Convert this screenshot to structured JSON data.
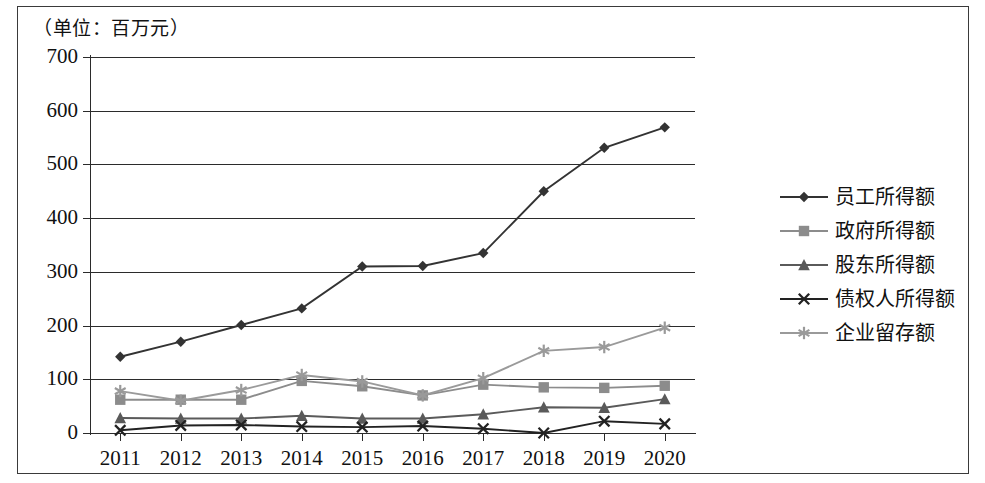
{
  "chart_data": {
    "type": "line",
    "title": "（单位：百万元）",
    "xlabel": "",
    "ylabel": "",
    "ylim": [
      0,
      700
    ],
    "ytick_step": 100,
    "yticks": [
      "0",
      "100",
      "200",
      "300",
      "400",
      "500",
      "600",
      "700"
    ],
    "grid": true,
    "legend_position": "right",
    "categories": [
      "2011",
      "2012",
      "2013",
      "2014",
      "2015",
      "2016",
      "2017",
      "2018",
      "2019",
      "2020"
    ],
    "series": [
      {
        "name": "员工所得额",
        "marker": "diamond",
        "color": "#333333",
        "values": [
          142,
          170,
          201,
          232,
          310,
          311,
          335,
          450,
          531,
          569
        ]
      },
      {
        "name": "政府所得额",
        "marker": "square",
        "color": "#8c8c8c",
        "values": [
          62,
          62,
          62,
          97,
          87,
          70,
          90,
          85,
          84,
          88
        ]
      },
      {
        "name": "股东所得额",
        "marker": "triangle",
        "color": "#5a5a5a",
        "values": [
          28,
          27,
          27,
          32,
          27,
          27,
          35,
          48,
          47,
          63
        ]
      },
      {
        "name": "债权人所得额",
        "marker": "cross",
        "color": "#222222",
        "values": [
          5,
          14,
          15,
          12,
          11,
          13,
          8,
          0,
          22,
          17
        ]
      },
      {
        "name": "企业留存额",
        "marker": "asterisk",
        "color": "#9a9a9a",
        "values": [
          78,
          60,
          80,
          108,
          96,
          70,
          102,
          153,
          160,
          196
        ]
      }
    ]
  },
  "legend": {
    "items": [
      {
        "label": "员工所得额"
      },
      {
        "label": "政府所得额"
      },
      {
        "label": "股东所得额"
      },
      {
        "label": "债权人所得额"
      },
      {
        "label": "企业留存额"
      }
    ]
  }
}
